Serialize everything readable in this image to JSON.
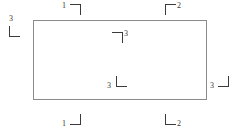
{
  "diagram": {
    "background_color": "#ffffff",
    "rectangle": {
      "stroke_color": "#8a8a8a",
      "x": 33,
      "y": 20,
      "width": 174,
      "height": 80
    },
    "marker_stroke_color": "#3a3a3a",
    "markers": [
      {
        "id": "marker-top-left-outside",
        "label": "1",
        "shape": "corner-top-right",
        "position": "above-rectangle-left",
        "x": 70,
        "y": 4,
        "label_x": 62,
        "label_y": 2
      },
      {
        "id": "marker-top-right-outside",
        "label": "2",
        "shape": "corner-top-left",
        "position": "above-rectangle-right",
        "x": 165,
        "y": 4,
        "label_x": 177,
        "label_y": 2
      },
      {
        "id": "marker-left-outside",
        "label": "3",
        "shape": "corner-bottom-left",
        "position": "left-of-rectangle",
        "x": 9,
        "y": 26,
        "label_x": 9,
        "label_y": 15
      },
      {
        "id": "marker-interior-upper",
        "label": "3",
        "shape": "corner-top-right",
        "position": "inside-rectangle-upper-center",
        "x": 112,
        "y": 32,
        "label_x": 124,
        "label_y": 30
      },
      {
        "id": "marker-interior-lower",
        "label": "3",
        "shape": "corner-bottom-left",
        "position": "inside-rectangle-lower-center",
        "x": 116,
        "y": 76,
        "label_x": 107,
        "label_y": 82
      },
      {
        "id": "marker-right-outside",
        "label": "3",
        "shape": "corner-bottom-right",
        "position": "right-of-rectangle",
        "x": 218,
        "y": 76,
        "label_x": 210,
        "label_y": 82
      },
      {
        "id": "marker-bottom-left-outside",
        "label": "1",
        "shape": "corner-bottom-right",
        "position": "below-rectangle-left",
        "x": 70,
        "y": 114,
        "label_x": 62,
        "label_y": 120
      },
      {
        "id": "marker-bottom-right-outside",
        "label": "2",
        "shape": "corner-bottom-left",
        "position": "below-rectangle-right",
        "x": 165,
        "y": 114,
        "label_x": 177,
        "label_y": 120
      }
    ]
  }
}
